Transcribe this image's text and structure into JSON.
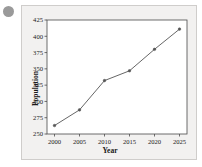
{
  "bullet": {
    "name": "list-bullet"
  },
  "chart_data": {
    "type": "line",
    "title": "",
    "xlabel": "Year",
    "ylabel": "Population",
    "x": [
      2000,
      2005,
      2010,
      2015,
      2020,
      2025
    ],
    "values": [
      263,
      287,
      332,
      347,
      380,
      411
    ],
    "categories": [
      "2000",
      "2005",
      "2010",
      "2015",
      "2020",
      "2025"
    ],
    "xtick_labels": [
      "2000",
      "2005",
      "2010",
      "2015",
      "2020",
      "2025"
    ],
    "ytick_labels": [
      "250",
      "275",
      "300",
      "325",
      "350",
      "375",
      "400",
      "425"
    ],
    "ytick_values": [
      250,
      275,
      300,
      325,
      350,
      375,
      400,
      425
    ],
    "xlim": [
      1998.5,
      2026.5
    ],
    "ylim": [
      250,
      425
    ],
    "grid": false,
    "legend": null,
    "marker": "dot",
    "line_color": "#555555",
    "marker_color": "#555555",
    "plot_background": "#ffffff",
    "card_background": "#f2f1f0",
    "border_color": "#cfcdcb"
  }
}
